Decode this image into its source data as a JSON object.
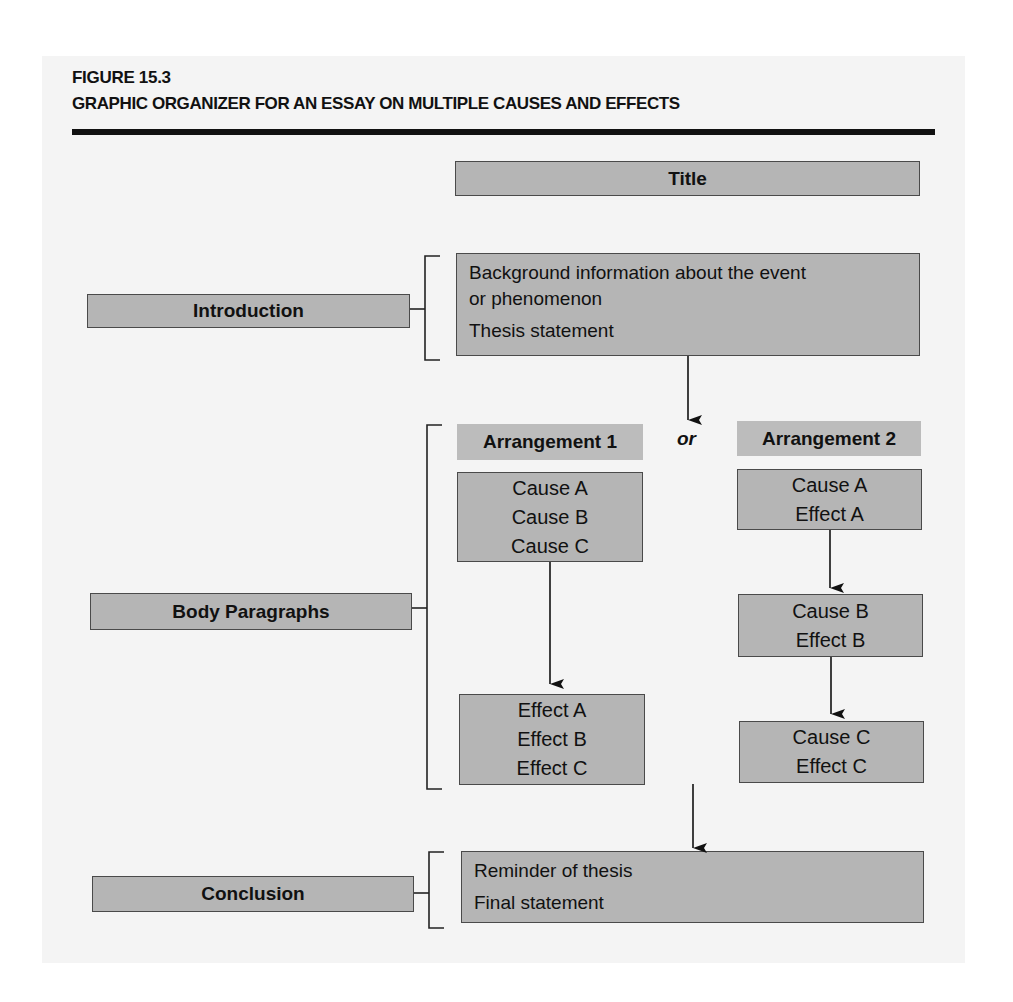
{
  "header": {
    "figure_number": "FIGURE 15.3",
    "figure_title": "GRAPHIC ORGANIZER FOR AN ESSAY ON MULTIPLE CAUSES AND EFFECTS"
  },
  "title_box": {
    "label": "Title"
  },
  "sections": {
    "introduction": {
      "label": "Introduction",
      "content": [
        "Background information about the event",
        "or phenomenon",
        "Thesis statement"
      ]
    },
    "body": {
      "label": "Body Paragraphs",
      "connector_word": "or",
      "arrangement_1": {
        "heading": "Arrangement 1",
        "causes": [
          "Cause A",
          "Cause B",
          "Cause C"
        ],
        "effects": [
          "Effect A",
          "Effect B",
          "Effect C"
        ]
      },
      "arrangement_2": {
        "heading": "Arrangement 2",
        "pairs": [
          [
            "Cause A",
            "Effect A"
          ],
          [
            "Cause B",
            "Effect B"
          ],
          [
            "Cause C",
            "Effect C"
          ]
        ]
      }
    },
    "conclusion": {
      "label": "Conclusion",
      "content": [
        "Reminder of thesis",
        "Final statement"
      ]
    }
  },
  "colors": {
    "panel_background": "#f4f4f4",
    "box_fill": "#b5b5b5",
    "header_fill": "#bcbcbc",
    "border": "#4a4a4a",
    "rule": "#111111"
  }
}
